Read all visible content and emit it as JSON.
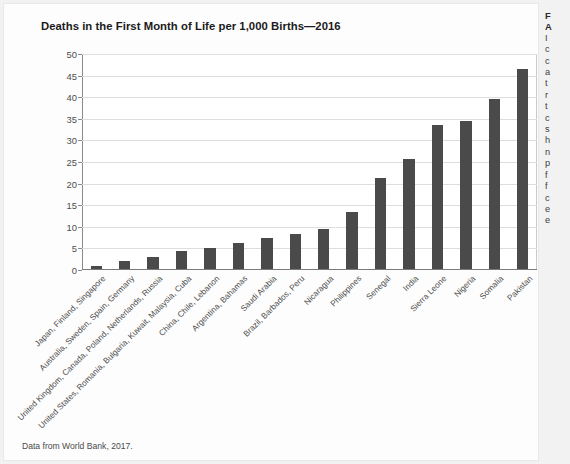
{
  "figure": {
    "title": "Deaths in the First Month of Life per 1,000 Births—2016",
    "source_note": "Data from World Bank, 2017."
  },
  "side_column": {
    "heading_line1": "F",
    "heading_line2": "A",
    "lines": [
      "I",
      "c",
      "c",
      "a",
      "t",
      "r",
      "t",
      "c",
      "s",
      "h",
      "n",
      "p",
      "f",
      "f",
      "c",
      "e",
      "e",
      "v",
      "r",
      "i",
      "i"
    ]
  },
  "chart_data": {
    "type": "bar",
    "title": "Deaths in the First Month of Life per 1,000 Births—2016",
    "xlabel": "",
    "ylabel": "",
    "ylim": [
      0,
      50
    ],
    "yticks": [
      0,
      5,
      10,
      15,
      20,
      25,
      30,
      35,
      40,
      45,
      50
    ],
    "grid": true,
    "legend": false,
    "bar_color": "#4a4a4a",
    "categories": [
      "Japan, Finland, Singapore",
      "Australia, Sweden, Spain, Germany",
      "United Kingdom, Canada, Poland, Netherlands, Russia",
      "United States, Romania, Bulgaria, Kuwait, Malaysia, Cuba",
      "China, Chile, Lebanon",
      "Argentina, Bahamas",
      "Saudi Arabia",
      "Brazil, Barbados, Peru",
      "Nicaragua",
      "Philippines",
      "Senegal",
      "India",
      "Sierra Leone",
      "Nigeria",
      "Somalia",
      "Pakistan"
    ],
    "values": [
      0.9,
      2.1,
      3.1,
      4.3,
      5.2,
      6.3,
      7.3,
      8.4,
      9.4,
      13.4,
      21.4,
      25.7,
      33.5,
      34.5,
      39.7,
      46.5
    ]
  }
}
